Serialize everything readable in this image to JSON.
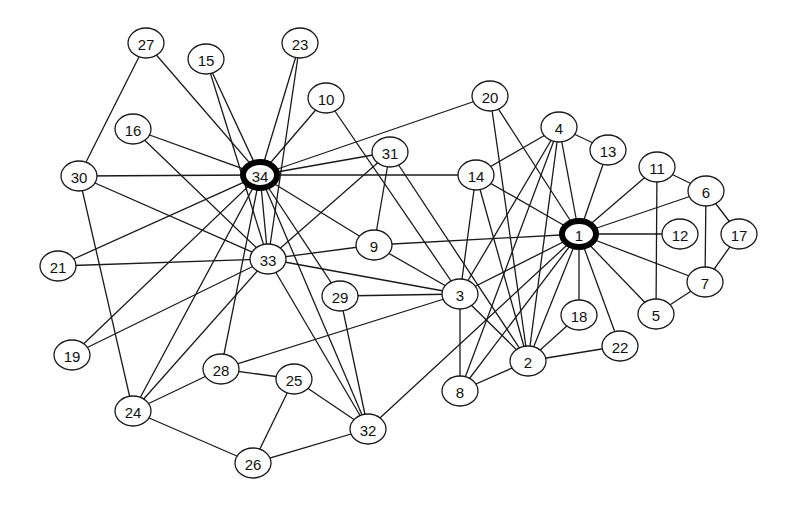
{
  "diagram": {
    "type": "network-graph",
    "hubs": [
      "1",
      "34"
    ],
    "nodes": [
      {
        "id": "1",
        "x": 579,
        "y": 234
      },
      {
        "id": "2",
        "x": 528,
        "y": 361
      },
      {
        "id": "3",
        "x": 460,
        "y": 294
      },
      {
        "id": "4",
        "x": 559,
        "y": 127
      },
      {
        "id": "5",
        "x": 656,
        "y": 314
      },
      {
        "id": "6",
        "x": 706,
        "y": 191
      },
      {
        "id": "7",
        "x": 705,
        "y": 282
      },
      {
        "id": "8",
        "x": 460,
        "y": 391
      },
      {
        "id": "9",
        "x": 374,
        "y": 245
      },
      {
        "id": "10",
        "x": 326,
        "y": 98
      },
      {
        "id": "11",
        "x": 657,
        "y": 167
      },
      {
        "id": "12",
        "x": 680,
        "y": 234
      },
      {
        "id": "13",
        "x": 608,
        "y": 150
      },
      {
        "id": "14",
        "x": 476,
        "y": 175
      },
      {
        "id": "15",
        "x": 206,
        "y": 59
      },
      {
        "id": "16",
        "x": 133,
        "y": 129
      },
      {
        "id": "17",
        "x": 739,
        "y": 234
      },
      {
        "id": "18",
        "x": 579,
        "y": 315
      },
      {
        "id": "19",
        "x": 72,
        "y": 355
      },
      {
        "id": "20",
        "x": 490,
        "y": 96
      },
      {
        "id": "21",
        "x": 58,
        "y": 266
      },
      {
        "id": "22",
        "x": 620,
        "y": 346
      },
      {
        "id": "23",
        "x": 300,
        "y": 43
      },
      {
        "id": "24",
        "x": 133,
        "y": 411
      },
      {
        "id": "25",
        "x": 294,
        "y": 379
      },
      {
        "id": "26",
        "x": 253,
        "y": 463
      },
      {
        "id": "27",
        "x": 146,
        "y": 43
      },
      {
        "id": "28",
        "x": 221,
        "y": 369
      },
      {
        "id": "29",
        "x": 340,
        "y": 296
      },
      {
        "id": "30",
        "x": 79,
        "y": 176
      },
      {
        "id": "31",
        "x": 390,
        "y": 152
      },
      {
        "id": "32",
        "x": 368,
        "y": 429
      },
      {
        "id": "33",
        "x": 268,
        "y": 259
      },
      {
        "id": "34",
        "x": 260,
        "y": 175
      }
    ],
    "edges": [
      [
        "1",
        "2"
      ],
      [
        "1",
        "3"
      ],
      [
        "1",
        "4"
      ],
      [
        "1",
        "5"
      ],
      [
        "1",
        "6"
      ],
      [
        "1",
        "7"
      ],
      [
        "1",
        "8"
      ],
      [
        "1",
        "9"
      ],
      [
        "1",
        "11"
      ],
      [
        "1",
        "12"
      ],
      [
        "1",
        "13"
      ],
      [
        "1",
        "14"
      ],
      [
        "1",
        "18"
      ],
      [
        "1",
        "20"
      ],
      [
        "1",
        "22"
      ],
      [
        "1",
        "32"
      ],
      [
        "2",
        "3"
      ],
      [
        "2",
        "4"
      ],
      [
        "2",
        "8"
      ],
      [
        "2",
        "14"
      ],
      [
        "2",
        "18"
      ],
      [
        "2",
        "20"
      ],
      [
        "2",
        "22"
      ],
      [
        "2",
        "31"
      ],
      [
        "3",
        "4"
      ],
      [
        "3",
        "8"
      ],
      [
        "3",
        "9"
      ],
      [
        "3",
        "10"
      ],
      [
        "3",
        "14"
      ],
      [
        "3",
        "28"
      ],
      [
        "3",
        "29"
      ],
      [
        "3",
        "33"
      ],
      [
        "4",
        "8"
      ],
      [
        "4",
        "13"
      ],
      [
        "4",
        "14"
      ],
      [
        "5",
        "7"
      ],
      [
        "5",
        "11"
      ],
      [
        "6",
        "7"
      ],
      [
        "6",
        "11"
      ],
      [
        "6",
        "17"
      ],
      [
        "7",
        "17"
      ],
      [
        "9",
        "31"
      ],
      [
        "9",
        "33"
      ],
      [
        "9",
        "34"
      ],
      [
        "10",
        "34"
      ],
      [
        "14",
        "34"
      ],
      [
        "15",
        "33"
      ],
      [
        "15",
        "34"
      ],
      [
        "16",
        "33"
      ],
      [
        "16",
        "34"
      ],
      [
        "19",
        "33"
      ],
      [
        "19",
        "34"
      ],
      [
        "20",
        "34"
      ],
      [
        "21",
        "33"
      ],
      [
        "21",
        "34"
      ],
      [
        "23",
        "33"
      ],
      [
        "23",
        "34"
      ],
      [
        "24",
        "26"
      ],
      [
        "24",
        "28"
      ],
      [
        "24",
        "30"
      ],
      [
        "24",
        "33"
      ],
      [
        "24",
        "34"
      ],
      [
        "25",
        "26"
      ],
      [
        "25",
        "28"
      ],
      [
        "25",
        "32"
      ],
      [
        "26",
        "32"
      ],
      [
        "27",
        "30"
      ],
      [
        "27",
        "34"
      ],
      [
        "28",
        "34"
      ],
      [
        "29",
        "32"
      ],
      [
        "29",
        "34"
      ],
      [
        "30",
        "33"
      ],
      [
        "30",
        "34"
      ],
      [
        "31",
        "33"
      ],
      [
        "31",
        "34"
      ],
      [
        "32",
        "33"
      ],
      [
        "32",
        "34"
      ],
      [
        "33",
        "34"
      ]
    ]
  }
}
